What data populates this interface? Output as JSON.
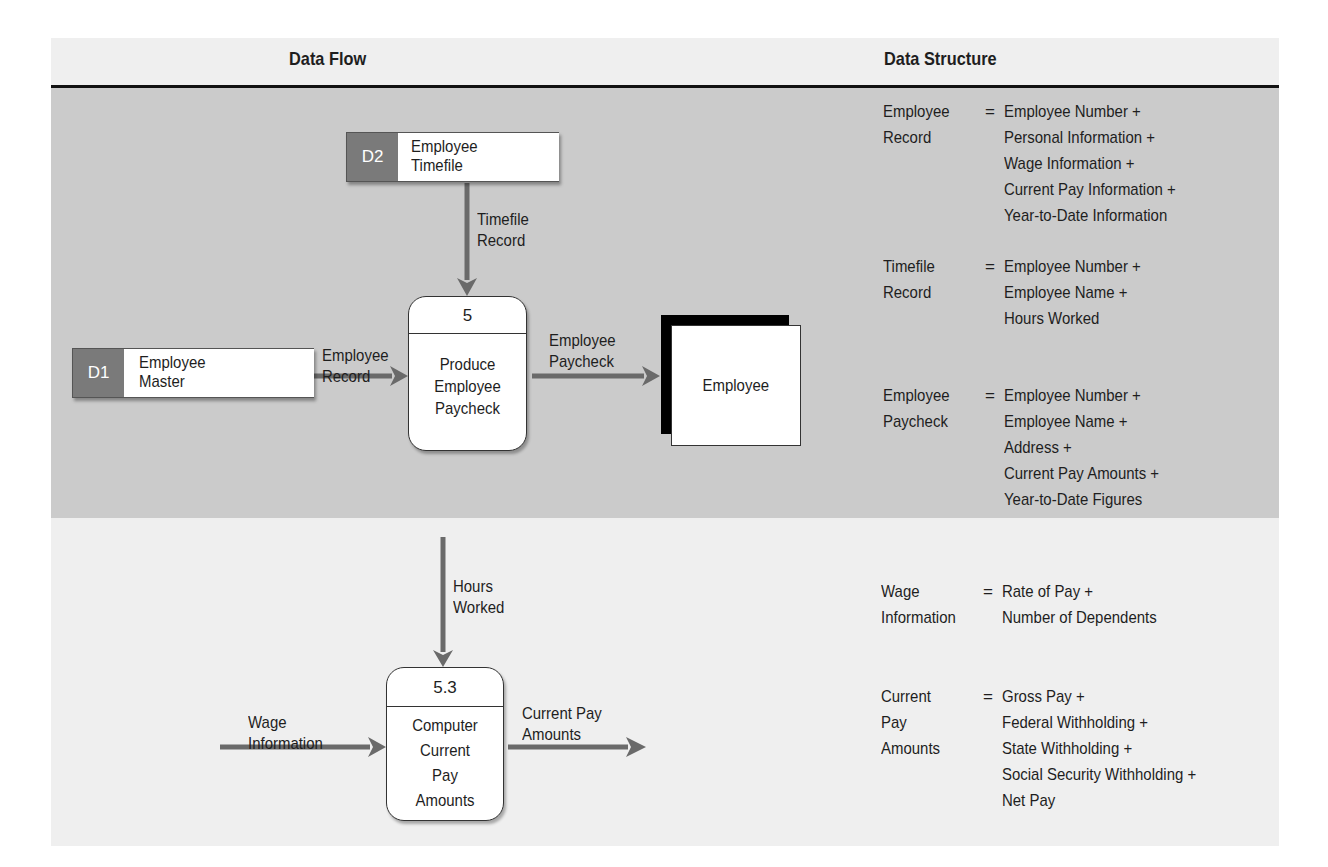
{
  "headers": {
    "data_flow": "Data Flow",
    "data_structure": "Data Structure"
  },
  "top_diagram": {
    "stores": [
      {
        "id": "D2",
        "name_lines": [
          "Employee",
          "Timefile"
        ]
      },
      {
        "id": "D1",
        "name_lines": [
          "Employee",
          "Master"
        ]
      }
    ],
    "process": {
      "id": "5",
      "name_lines": [
        "Produce",
        "Employee",
        "Paycheck"
      ]
    },
    "entity": {
      "name": "Employee"
    },
    "flows": [
      {
        "label_lines": [
          "Timefile",
          "Record"
        ],
        "from": "D2",
        "to": "5"
      },
      {
        "label_lines": [
          "Employee",
          "Record"
        ],
        "from": "D1",
        "to": "5"
      },
      {
        "label_lines": [
          "Employee",
          "Paycheck"
        ],
        "from": "5",
        "to": "Employee"
      }
    ]
  },
  "bottom_diagram": {
    "process": {
      "id": "5.3",
      "name_lines": [
        "Computer",
        "Current",
        "Pay",
        "Amounts"
      ]
    },
    "flows": [
      {
        "label_lines": [
          "Hours",
          "Worked"
        ],
        "to": "5.3"
      },
      {
        "label_lines": [
          "Wage",
          "Information"
        ],
        "to": "5.3"
      },
      {
        "label_lines": [
          "Current Pay",
          "Amounts"
        ],
        "from": "5.3"
      }
    ]
  },
  "definitions": [
    {
      "term_lines": [
        "Employee",
        "Record"
      ],
      "eq": "=",
      "parts": [
        "Employee Number +",
        "Personal Information +",
        "Wage Information +",
        "Current Pay Information +",
        "Year-to-Date Information"
      ]
    },
    {
      "term_lines": [
        "Timefile",
        "Record"
      ],
      "eq": "=",
      "parts": [
        "Employee Number +",
        "Employee Name +",
        "Hours Worked"
      ]
    },
    {
      "term_lines": [
        "Employee",
        "Paycheck"
      ],
      "eq": "=",
      "parts": [
        "Employee Number +",
        "Employee Name +",
        "Address +",
        "Current Pay Amounts +",
        "Year-to-Date Figures"
      ]
    },
    {
      "term_lines": [
        "Wage",
        "Information"
      ],
      "eq": "=",
      "parts": [
        "Rate of Pay +",
        "Number of Dependents"
      ]
    },
    {
      "term_lines": [
        "Current",
        "Pay",
        "Amounts"
      ],
      "eq": "=",
      "parts": [
        "Gross Pay +",
        "Federal Withholding +",
        "State Withholding +",
        "Social Security Withholding +",
        "Net Pay"
      ]
    }
  ],
  "colors": {
    "header_band": "#efefef",
    "top_band": "#cbcbcb",
    "bottom_band": "#efefef",
    "store_id_fill": "#7a7a7a",
    "arrow": "#6a6a6a",
    "rule": "#111111"
  }
}
